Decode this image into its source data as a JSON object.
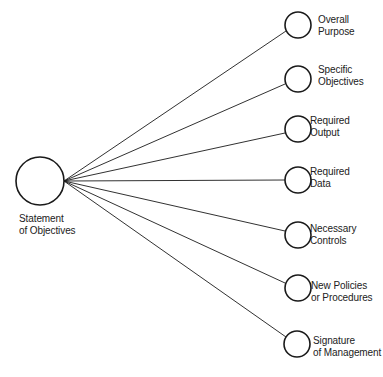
{
  "diagram": {
    "root": {
      "label_lines": [
        "Statement",
        "of Objectives"
      ],
      "cx": 40,
      "cy": 181,
      "r": 24
    },
    "children": [
      {
        "label_lines": [
          "Overall",
          "Purpose"
        ],
        "cx": 298,
        "cy": 25
      },
      {
        "label_lines": [
          "Specific",
          "Objectives"
        ],
        "cx": 298,
        "cy": 79
      },
      {
        "label_lines": [
          "Required",
          "Output"
        ],
        "cx": 298,
        "cy": 129
      },
      {
        "label_lines": [
          "Required",
          "Data"
        ],
        "cx": 298,
        "cy": 180
      },
      {
        "label_lines": [
          "Necessary",
          "Controls"
        ],
        "cx": 298,
        "cy": 235
      },
      {
        "label_lines": [
          "New Policies",
          "or Procedures"
        ],
        "cx": 298,
        "cy": 288
      },
      {
        "label_lines": [
          "Signature",
          "of Management"
        ],
        "cx": 297,
        "cy": 344
      }
    ],
    "child_radius": 13,
    "stroke_color": "#1a1a1a"
  }
}
